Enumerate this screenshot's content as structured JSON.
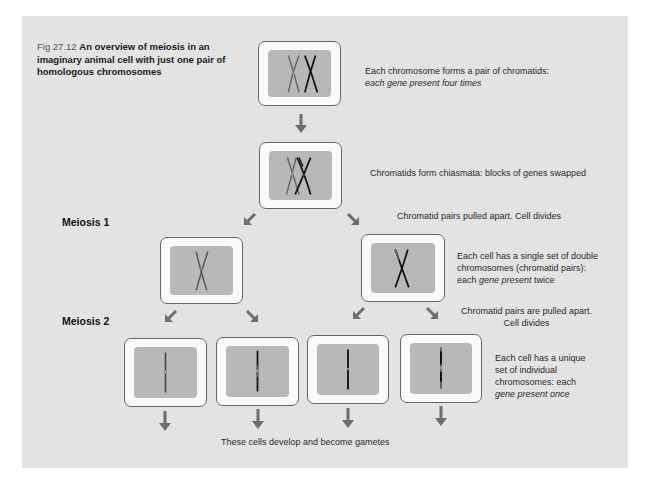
{
  "figure": {
    "number": "Fig 27.12",
    "title": "An overview of meiosis in an imaginary animal cell with just one pair of homologous chromosomes"
  },
  "stages": {
    "meiosis1": "Meiosis 1",
    "meiosis2": "Meiosis 2"
  },
  "notes": {
    "step1_line1": "Each chromosome forms a pair of chromatids:",
    "step1_line2": "each gene present four times",
    "step2": "Chromatids form chiasmata: blocks of genes swapped",
    "step3": "Chromatid pairs pulled apart.  Cell divides",
    "step4_line1": "Each cell has a single set of double",
    "step4_line2": "chromosomes (chromatid pairs):",
    "step4_line3_pre": "each ",
    "step4_line3_italic": "gene present",
    "step4_line3_post": " twice",
    "step5_line1": "Chromatid pairs are pulled apart.",
    "step5_line2": "Cell divides",
    "step6_line1": "Each cell has a unique",
    "step6_line2": "set of individual",
    "step6_line3": "chromosomes: each",
    "step6_line4": "gene present once",
    "gametes": "These cells develop and become gametes"
  },
  "colors": {
    "panel": "#e3e3e3",
    "cell_outer": "#fafafa",
    "cell_inner": "#b8b8b8",
    "arrow": "#6e6e6e",
    "chromosome_dark": "#111111",
    "chromosome_grey": "#5a5a5a"
  }
}
